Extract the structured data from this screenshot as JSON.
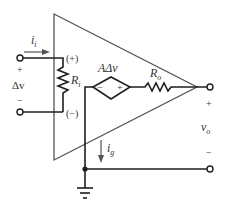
{
  "diagram": {
    "labels": {
      "input_current": "i",
      "input_current_sub": "i",
      "input_plus_terminal": "(+)",
      "input_minus_terminal": "(−)",
      "input_voltage_plus": "+",
      "input_voltage": "Δv",
      "input_voltage_minus": "−",
      "input_resistor": "R",
      "input_resistor_sub": "i",
      "dependent_source": "AΔv",
      "dependent_source_minus": "−",
      "dependent_source_plus": "+",
      "output_resistor": "R",
      "output_resistor_sub": "o",
      "output_plus": "+",
      "output_voltage": "v",
      "output_voltage_sub": "o",
      "output_minus": "−",
      "ground_current": "i",
      "ground_current_sub": "g"
    },
    "components": [
      {
        "type": "triangle",
        "name": "op-amp body"
      },
      {
        "type": "resistor",
        "name": "Ri",
        "orientation": "vertical"
      },
      {
        "type": "dependent-voltage-source",
        "name": "AΔv",
        "shape": "diamond"
      },
      {
        "type": "resistor",
        "name": "Ro",
        "orientation": "horizontal"
      },
      {
        "type": "ground",
        "name": "ground"
      }
    ],
    "colors": {
      "wire": "#1f1f1f",
      "outline": "#555555",
      "text": "#333333"
    }
  }
}
